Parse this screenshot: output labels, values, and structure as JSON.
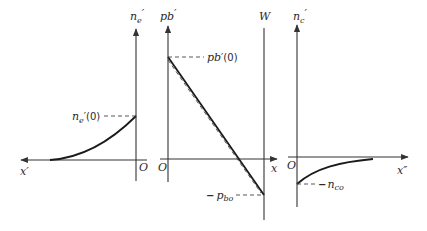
{
  "colors": {
    "background": "#ffffff",
    "ink": "#1a1a1a",
    "axis": "#333333"
  },
  "panels": [
    {
      "id": "electron-panel",
      "y_axis_label": "n",
      "y_axis_sub": "e",
      "y_axis_prime": "′",
      "x_axis_label": "x′",
      "origin_label": "O",
      "marker_label": "n",
      "marker_sub": "e",
      "marker_suffix": "′(0)",
      "curve": "rises from 0 far along x′ to n_e′(0) at O (concave)"
    },
    {
      "id": "base-panel",
      "y_axis_label": "p",
      "y_axis_sub": "b",
      "y_axis_prime": "′",
      "x_axis_label": "x",
      "origin_label": "O",
      "boundary_label": "W",
      "top_marker_label": "p",
      "top_marker_sub": "b",
      "top_marker_suffix": "′(0)",
      "bottom_marker_prefix": "−",
      "bottom_marker_label": "p",
      "bottom_marker_sub": "bo",
      "curve": "linear from p_b′(0) at O down to −p_bo at W, with dashed near-parallel line"
    },
    {
      "id": "collector-panel",
      "y_axis_label": "n",
      "y_axis_sub": "c",
      "y_axis_prime": "′",
      "x_axis_label": "x″",
      "origin_label": "O",
      "marker_prefix": "−",
      "marker_label": "n",
      "marker_sub": "co",
      "curve": "rises from −n_co at O toward 0 along x″"
    }
  ]
}
